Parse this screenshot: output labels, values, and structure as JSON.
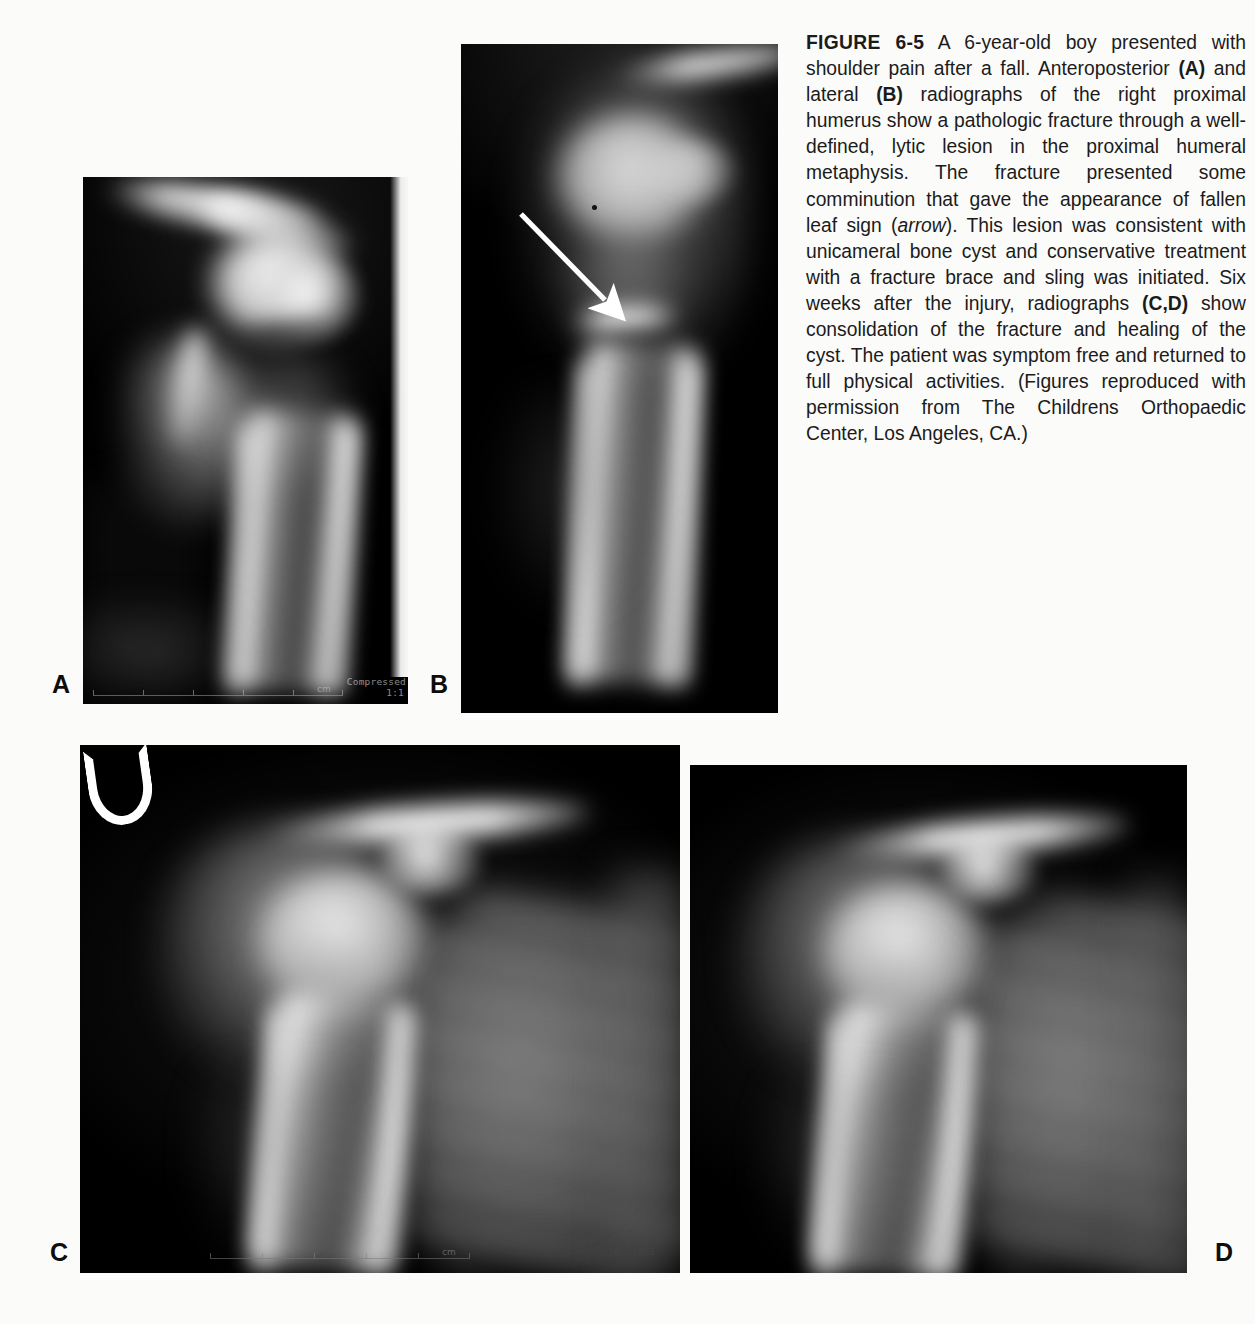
{
  "figure": {
    "number_label": "FIGURE 6-5",
    "caption_parts": {
      "p1": " A 6-year-old boy presented with shoulder pain after a fall. Anteroposterior ",
      "ref_a": "(A)",
      "p2": " and lateral ",
      "ref_b": "(B)",
      "p3": " radiographs of the right proximal humerus show a pathologic fracture through a well-defined, lytic lesion in the proximal humeral metaphysis. The fracture presented some comminution that gave the appearance of fallen leaf sign (",
      "arrow_word": "arrow",
      "p4": "). This lesion was consistent with unicameral bone cyst and conservative treatment with a fracture brace and sling was initiated. Six weeks after the injury, radiographs ",
      "ref_cd": "(C,D)",
      "p5": " show consolidation of the fracture and healing of the cyst. The patient was symptom free and returned to full physical activities. (Figures reproduced with permission from The Childrens Orthopaedic Center, Los Angeles, CA.)"
    },
    "caption_full": "FIGURE 6-5 A 6-year-old boy presented with shoulder pain after a fall. Anteroposterior (A) and lateral (B) radiographs of the right proximal humerus show a pathologic fracture through a well-defined, lytic lesion in the proximal humeral metaphysis. The fracture presented some comminution that gave the appearance of fallen leaf sign (arrow). This lesion was consistent with unicameral bone cyst and conservative treatment with a fracture brace and sling was initiated. Six weeks after the injury, radiographs (C,D) show consolidation of the fracture and healing of the cyst. The patient was symptom free and returned to full physical activities. (Figures reproduced with permission from The Childrens Orthopaedic Center, Los Angeles, CA.)"
  },
  "panels": [
    {
      "label": "A",
      "view": "anteroposterior",
      "body_part": "right proximal humerus",
      "overlay_text_line1": "Compressed",
      "overlay_text_line2": "1:1",
      "ruler_unit": "cm"
    },
    {
      "label": "B",
      "view": "lateral",
      "body_part": "right proximal humerus",
      "annotation": "arrow",
      "annotation_meaning": "fallen leaf sign"
    },
    {
      "label": "C",
      "view": "anteroposterior follow-up",
      "body_part": "right shoulder",
      "overlay_text_line1": "Compressed 52:1",
      "overlay_text_line2": "JQ: 1001",
      "ruler_unit": "cm"
    },
    {
      "label": "D",
      "view": "follow-up oblique",
      "body_part": "right shoulder"
    }
  ],
  "colors": {
    "page_background": "#fbfbfa",
    "film_background": "#000000",
    "caption_text": "#1b1b1b",
    "label_text": "#0d0d0d",
    "arrow": "#ffffff"
  }
}
